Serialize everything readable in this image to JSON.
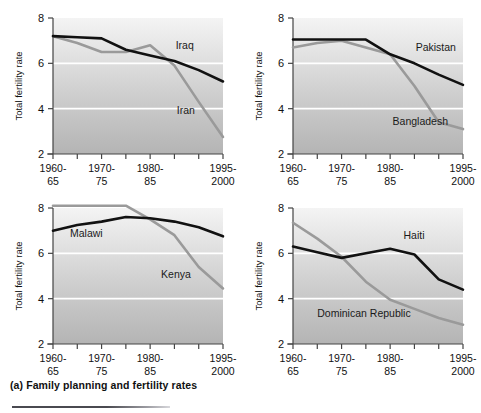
{
  "caption": "(a) Family planning and fertility rates",
  "axis": {
    "ylabel": "Total fertility rate",
    "yticks": [
      "2",
      "4",
      "6",
      "8"
    ],
    "ylim": [
      2,
      8
    ],
    "xtick_labels": [
      {
        "top": "1960-",
        "bottom": "65"
      },
      {
        "top": "1970-",
        "bottom": "75"
      },
      {
        "top": "1980-",
        "bottom": "85"
      },
      {
        "top": "1995-",
        "bottom": "2000"
      }
    ]
  },
  "colors": {
    "dark_series": "#111111",
    "light_series": "#9a9a9a",
    "gridline": "#ffffff",
    "plot_top": "#f4f4f4",
    "plot_bottom": "#b4b4b4",
    "axis": "#444444"
  },
  "chart_data": [
    {
      "type": "line",
      "panel": "top-left",
      "title": "",
      "xlabel": "",
      "ylabel": "Total fertility rate",
      "ylim": [
        2,
        8
      ],
      "grid": true,
      "legend_position": "inline",
      "categories": [
        "1960-65",
        "1965-70",
        "1970-75",
        "1975-80",
        "1980-85",
        "1985-90",
        "1990-95",
        "1995-2000"
      ],
      "series": [
        {
          "name": "Iraq",
          "color": "#111111",
          "values": [
            7.2,
            7.15,
            7.1,
            6.6,
            6.35,
            6.1,
            5.7,
            5.2
          ],
          "label_x": 5.05,
          "label_y": 6.62
        },
        {
          "name": "Iran",
          "color": "#9a9a9a",
          "values": [
            7.2,
            6.9,
            6.5,
            6.5,
            6.8,
            5.9,
            4.3,
            2.75
          ],
          "label_x": 5.1,
          "label_y": 3.78
        }
      ]
    },
    {
      "type": "line",
      "panel": "top-right",
      "title": "",
      "xlabel": "",
      "ylabel": "Total fertility rate",
      "ylim": [
        2,
        8
      ],
      "grid": true,
      "legend_position": "inline",
      "categories": [
        "1960-65",
        "1965-70",
        "1970-75",
        "1975-80",
        "1980-85",
        "1985-90",
        "1990-95",
        "1995-2000"
      ],
      "series": [
        {
          "name": "Pakistan",
          "color": "#111111",
          "values": [
            7.05,
            7.05,
            7.05,
            7.05,
            6.4,
            6.0,
            5.5,
            5.05
          ],
          "label_x": 5.05,
          "label_y": 6.55
        },
        {
          "name": "Bangladesh",
          "color": "#9a9a9a",
          "values": [
            6.7,
            6.9,
            7.0,
            6.7,
            6.4,
            5.0,
            3.4,
            3.1
          ],
          "label_x": 4.1,
          "label_y": 3.28
        }
      ]
    },
    {
      "type": "line",
      "panel": "bottom-left",
      "title": "",
      "xlabel": "",
      "ylabel": "Total fertility rate",
      "ylim": [
        2,
        8
      ],
      "grid": true,
      "legend_position": "inline",
      "categories": [
        "1960-65",
        "1965-70",
        "1970-75",
        "1975-80",
        "1980-85",
        "1985-90",
        "1990-95",
        "1995-2000"
      ],
      "series": [
        {
          "name": "Malawi",
          "color": "#111111",
          "values": [
            7.0,
            7.25,
            7.4,
            7.6,
            7.55,
            7.4,
            7.15,
            6.75
          ],
          "label_x": 0.7,
          "label_y": 6.72
        },
        {
          "name": "Kenya",
          "color": "#9a9a9a",
          "values": [
            8.1,
            8.1,
            8.1,
            8.1,
            7.5,
            6.8,
            5.4,
            4.45
          ],
          "label_x": 4.45,
          "label_y": 4.93
        }
      ]
    },
    {
      "type": "line",
      "panel": "bottom-right",
      "title": "",
      "xlabel": "",
      "ylabel": "Total fertility rate",
      "ylim": [
        2,
        8
      ],
      "grid": true,
      "legend_position": "inline",
      "categories": [
        "1960-65",
        "1965-70",
        "1970-75",
        "1975-80",
        "1980-85",
        "1985-90",
        "1990-95",
        "1995-2000"
      ],
      "series": [
        {
          "name": "Haiti",
          "color": "#111111",
          "values": [
            6.3,
            6.05,
            5.8,
            6.0,
            6.2,
            5.95,
            4.85,
            4.4
          ],
          "label_x": 4.55,
          "label_y": 6.62
        },
        {
          "name": "Dominican Republic",
          "color": "#9a9a9a",
          "values": [
            7.35,
            6.65,
            5.85,
            4.75,
            3.95,
            3.55,
            3.15,
            2.85
          ],
          "label_x": 1.0,
          "label_y": 3.18
        }
      ]
    }
  ]
}
